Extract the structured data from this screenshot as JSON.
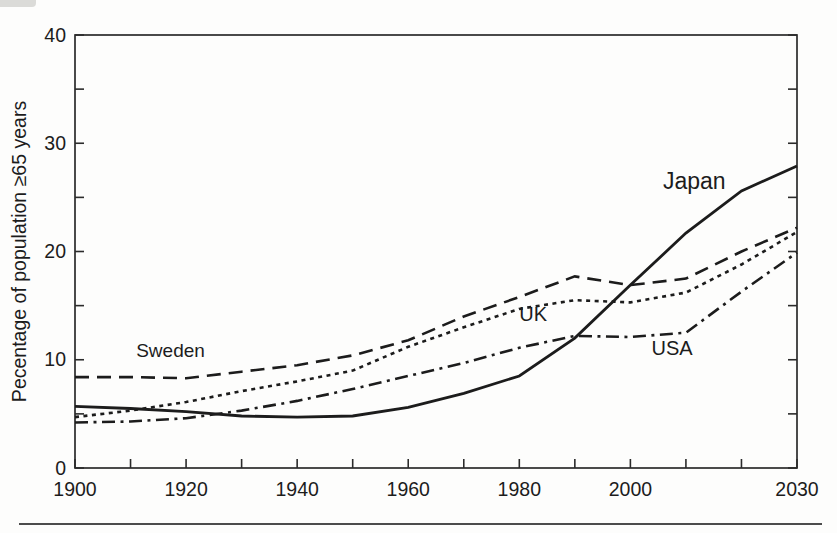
{
  "chart_data": {
    "type": "line",
    "title": "",
    "xlabel": "",
    "ylabel": "Pecentage of population ≥65 years",
    "xlim": [
      1900,
      2030
    ],
    "ylim": [
      0,
      40
    ],
    "grid": false,
    "legend_position": "inline-labels",
    "axis_color": "#2b2b2b",
    "line_color": "#1c1c1c",
    "x_major_tick_labels": [
      1900,
      1920,
      1940,
      1960,
      1980,
      2000,
      2030
    ],
    "x_minor_tick_step": 10,
    "y_major_tick_labels": [
      0,
      10,
      20,
      30,
      40
    ],
    "y_minor_tick_step": 5,
    "x": [
      1900,
      1910,
      1920,
      1930,
      1940,
      1950,
      1960,
      1970,
      1980,
      1990,
      2000,
      2010,
      2020,
      2030
    ],
    "series": [
      {
        "name": "Sweden",
        "dash": "long-dash",
        "values": [
          8.4,
          8.4,
          8.3,
          8.9,
          9.5,
          10.4,
          11.8,
          14.0,
          15.8,
          17.7,
          16.9,
          17.5,
          20.0,
          22.2
        ],
        "label": {
          "text": "Sweden",
          "year": 1917.2,
          "value": 10.3,
          "font_size": 19
        }
      },
      {
        "name": "UK",
        "dash": "short-dash",
        "values": [
          4.7,
          5.3,
          6.1,
          7.1,
          8.0,
          9.0,
          11.2,
          13.0,
          14.7,
          15.5,
          15.3,
          16.2,
          18.8,
          21.8
        ],
        "label": {
          "text": "UK",
          "year": 1982.5,
          "value": 13.6,
          "font_size": 20
        }
      },
      {
        "name": "USA",
        "dash": "dash-dot",
        "values": [
          4.2,
          4.3,
          4.6,
          5.3,
          6.2,
          7.3,
          8.5,
          9.7,
          11.1,
          12.2,
          12.1,
          12.5,
          16.3,
          19.9
        ],
        "label": {
          "text": "USA",
          "year": 2007.5,
          "value": 10.4,
          "font_size": 20
        }
      },
      {
        "name": "Japan",
        "dash": "solid",
        "values": [
          5.7,
          5.5,
          5.2,
          4.8,
          4.7,
          4.8,
          5.6,
          6.9,
          8.5,
          12.0,
          16.9,
          21.7,
          25.6,
          27.9
        ],
        "label": {
          "text": "Japan",
          "year": 2011.5,
          "value": 25.8,
          "font_size": 23
        }
      }
    ]
  }
}
